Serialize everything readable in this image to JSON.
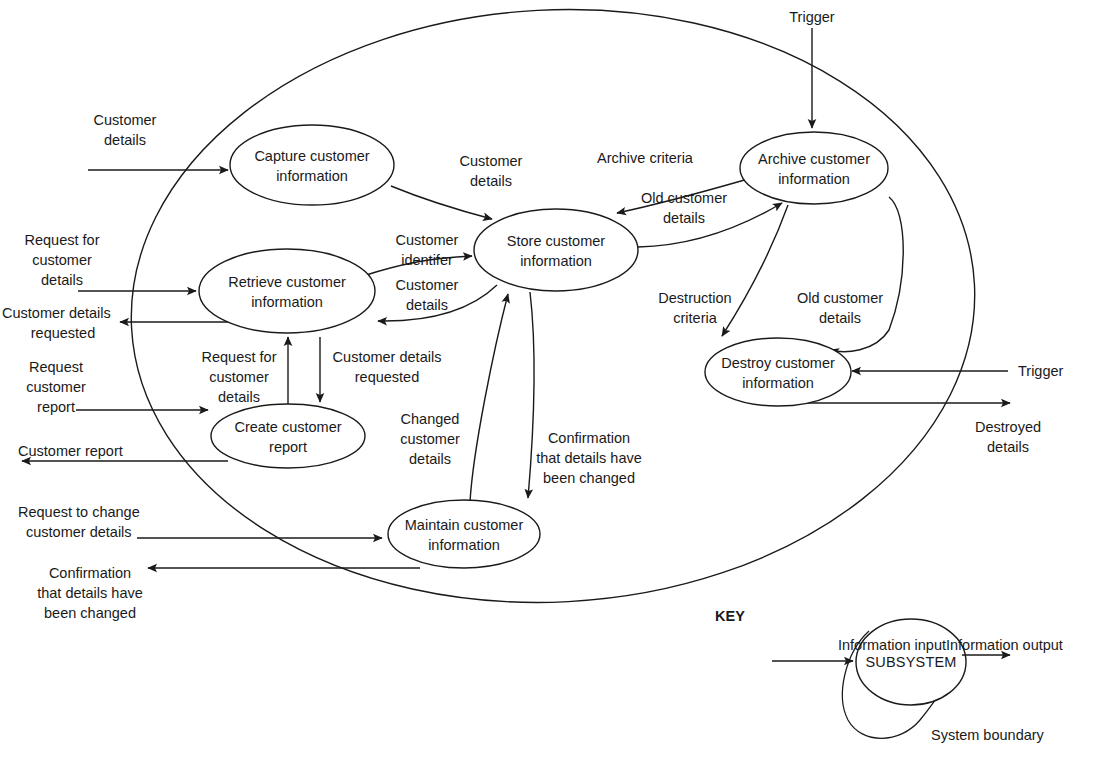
{
  "diagram": {
    "type": "data-flow-diagram",
    "processes": [
      {
        "id": "capture",
        "line1": "Capture customer",
        "line2": "information"
      },
      {
        "id": "retrieve",
        "line1": "Retrieve customer",
        "line2": "information"
      },
      {
        "id": "store",
        "line1": "Store customer",
        "line2": "information"
      },
      {
        "id": "archive",
        "line1": "Archive customer",
        "line2": "information"
      },
      {
        "id": "destroy",
        "line1": "Destroy customer",
        "line2": "information"
      },
      {
        "id": "create",
        "line1": "Create customer",
        "line2": "report"
      },
      {
        "id": "maintain",
        "line1": "Maintain customer",
        "line2": "information"
      }
    ],
    "flows": [
      {
        "id": "customer-details-in",
        "lines": [
          "Customer",
          "details"
        ]
      },
      {
        "id": "request-for-customer-details-ext",
        "lines": [
          "Request for",
          "customer",
          "details"
        ]
      },
      {
        "id": "customer-details-requested-out",
        "lines": [
          "Customer details",
          "requested"
        ]
      },
      {
        "id": "request-customer-report",
        "lines": [
          "Request",
          "customer",
          "report"
        ]
      },
      {
        "id": "customer-report-out",
        "lines": [
          "Customer report"
        ]
      },
      {
        "id": "request-to-change-customer-details",
        "lines": [
          "Request to change",
          "customer details"
        ]
      },
      {
        "id": "confirmation-out",
        "lines": [
          "Confirmation",
          "that details have",
          "been changed"
        ]
      },
      {
        "id": "capture-to-store",
        "lines": [
          "Customer",
          "details"
        ]
      },
      {
        "id": "customer-identifer",
        "lines": [
          "Customer",
          "identifer"
        ]
      },
      {
        "id": "store-to-retrieve",
        "lines": [
          "Customer",
          "details"
        ]
      },
      {
        "id": "archive-criteria",
        "lines": [
          "Archive criteria"
        ]
      },
      {
        "id": "old-customer-details-store",
        "lines": [
          "Old customer",
          "details"
        ]
      },
      {
        "id": "destruction-criteria",
        "lines": [
          "Destruction",
          "criteria"
        ]
      },
      {
        "id": "old-customer-details-destroy",
        "lines": [
          "Old customer",
          "details"
        ]
      },
      {
        "id": "trigger-archive",
        "lines": [
          "Trigger"
        ]
      },
      {
        "id": "trigger-destroy",
        "lines": [
          "Trigger"
        ]
      },
      {
        "id": "destroyed-details",
        "lines": [
          "Destroyed",
          "details"
        ]
      },
      {
        "id": "request-for-customer-details-int",
        "lines": [
          "Request for",
          "customer",
          "details"
        ]
      },
      {
        "id": "customer-details-requested-int",
        "lines": [
          "Customer details",
          "requested"
        ]
      },
      {
        "id": "changed-customer-details",
        "lines": [
          "Changed",
          "customer",
          "details"
        ]
      },
      {
        "id": "confirmation-internal",
        "lines": [
          "Confirmation",
          "that details have",
          "been changed"
        ]
      }
    ]
  },
  "labels": {
    "customer_details_in_1": "Customer",
    "customer_details_in_2": "details",
    "request_for_customer_details_ext_1": "Request for",
    "request_for_customer_details_ext_2": "customer",
    "request_for_customer_details_ext_3": "details",
    "customer_details_requested_out_1": "Customer details",
    "customer_details_requested_out_2": "requested",
    "request_customer_report_1": "Request",
    "request_customer_report_2": "customer",
    "request_customer_report_3": "report",
    "customer_report_out_1": "Customer report",
    "request_to_change_1": "Request to change",
    "request_to_change_2": "customer details",
    "confirmation_out_1": "Confirmation",
    "confirmation_out_2": "that details have",
    "confirmation_out_3": "been changed",
    "capture_to_store_1": "Customer",
    "capture_to_store_2": "details",
    "customer_identifer_1": "Customer",
    "customer_identifer_2": "identifer",
    "store_to_retrieve_1": "Customer",
    "store_to_retrieve_2": "details",
    "archive_criteria_1": "Archive criteria",
    "old_customer_details_store_1": "Old customer",
    "old_customer_details_store_2": "details",
    "destruction_criteria_1": "Destruction",
    "destruction_criteria_2": "criteria",
    "old_customer_details_destroy_1": "Old customer",
    "old_customer_details_destroy_2": "details",
    "trigger_archive": "Trigger",
    "trigger_destroy": "Trigger",
    "destroyed_details_1": "Destroyed",
    "destroyed_details_2": "details",
    "request_for_customer_details_int_1": "Request for",
    "request_for_customer_details_int_2": "customer",
    "request_for_customer_details_int_3": "details",
    "customer_details_requested_int_1": "Customer details",
    "customer_details_requested_int_2": "requested",
    "changed_customer_details_1": "Changed",
    "changed_customer_details_2": "customer",
    "changed_customer_details_3": "details",
    "confirmation_internal_1": "Confirmation",
    "confirmation_internal_2": "that details have",
    "confirmation_internal_3": "been changed"
  },
  "processes": {
    "capture_1": "Capture customer",
    "capture_2": "information",
    "retrieve_1": "Retrieve customer",
    "retrieve_2": "information",
    "store_1": "Store customer",
    "store_2": "information",
    "archive_1": "Archive customer",
    "archive_2": "information",
    "destroy_1": "Destroy customer",
    "destroy_2": "information",
    "create_1": "Create customer",
    "create_2": "report",
    "maintain_1": "Maintain customer",
    "maintain_2": "information"
  },
  "key": {
    "title": "KEY",
    "information_input": "Information input",
    "subsystem": "SUBSYSTEM",
    "information_output": "Information output",
    "system_boundary": "System boundary"
  },
  "colors": {
    "ink": "#1a1a1a",
    "background": "#ffffff"
  }
}
